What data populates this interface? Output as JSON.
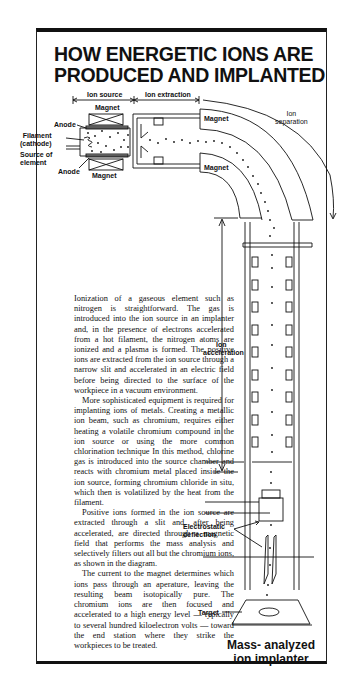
{
  "title": {
    "line1": "HOW ENERGETIC IONS ARE",
    "line2": "PRODUCED AND IMPLANTED"
  },
  "diagram": {
    "labels": {
      "ion_source": "Ion source",
      "ion_extraction": "Ion extraction",
      "magnet_top": "Magnet",
      "magnet_bottom": "Magnet",
      "magnet_bend_outer": "Magnet",
      "magnet_bend_inner": "Magnet",
      "anode_top": "Anode",
      "anode_bottom": "Anode",
      "filament_1": "Filament",
      "filament_2": "(cathode)",
      "source_1": "Source of",
      "source_2": "element",
      "ion_separation_1": "Ion",
      "ion_separation_2": "separation",
      "ion_acceleration_1": "Ion",
      "ion_acceleration_2": "acceleration",
      "electrostatic_1": "Electrostatic",
      "electrostatic_2": "deflection",
      "target": "Target"
    },
    "caption_line1": "Mass- analyzed",
    "caption_line2": "ion implanter"
  },
  "article": {
    "paragraphs": [
      "Ionization of a gaseous element such as nitrogen is straightforward. The gas is introduced into the ion source in an implanter and, in the presence of electrons accelerated from a hot filament, the nitrogen atoms are ionized and a plasma is formed. The positive ions are extracted from the ion source through a narrow slit and accelerated in an electric field before being directed to the surface of the workpiece in a vacuum environment.",
      "More sophisticated equipment is required for implanting ions of metals. Creating a metallic ion beam, such as chromium, requires either heating a volatile chromium compound in the ion source or using the more common chlorination technique In this method, chlorine gas is introduced into the source chamber and reacts with chromium metal placed inside the ion source, forming chromium chloride in situ, which then is volatilized by the heat from the filament.",
      "Positive ions formed in the ion source are extracted through a slit and, after being accelerated, are directed through a magnetic field that performs the mass analysis and selectively filters out all but the chromium ions, as shown in the diagram.",
      "The current to the magnet determines which ions pass through an aperature, leaving the resulting beam isotopically pure. The chromium ions are then focused and accelerated to a high energy level — typically to several hundred kiloelectron volts — toward the end station where they strike the workpieces to be treated."
    ]
  }
}
